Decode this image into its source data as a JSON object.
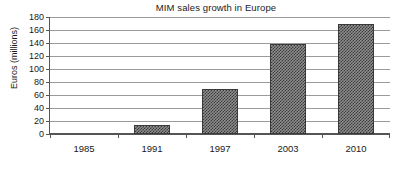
{
  "chart_data": {
    "type": "bar",
    "title": "MIM sales growth in Europe",
    "xlabel": "",
    "ylabel": "Euros (millions)",
    "categories": [
      "1985",
      "1991",
      "1997",
      "2003",
      "2010"
    ],
    "values": [
      0,
      14,
      69,
      139,
      169
    ],
    "series": [
      {
        "name": "MIM sales",
        "values": [
          0,
          14,
          69,
          139,
          169
        ]
      }
    ],
    "ylim": [
      0,
      180
    ],
    "ytick_values": [
      0,
      20,
      40,
      60,
      80,
      100,
      120,
      140,
      160,
      180
    ],
    "ytick_labels": [
      "0",
      "20",
      "40",
      "60",
      "80",
      "100",
      "120",
      "140",
      "160",
      "180"
    ],
    "grid": true,
    "legend": false,
    "legend_position": "none",
    "bar_fill": "#3c3c3c",
    "bar_pattern": "checkerboard",
    "axis_color": "#555555",
    "grid_color": "#9b9b9b",
    "background": "#ffffff"
  }
}
